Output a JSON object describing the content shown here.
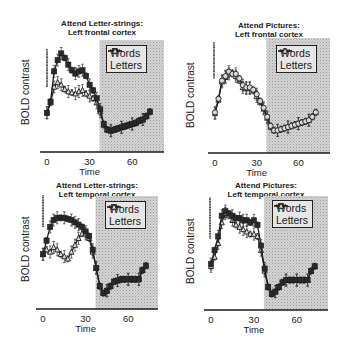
{
  "figure": {
    "panels": [
      {
        "title_line1": "Attend Letter-strings:",
        "title_line2": "Left frontal cortex",
        "ylabel": "BOLD contrast",
        "xlabel": "Time",
        "xticks": [
          "0",
          "30",
          "60"
        ],
        "legend": [
          "Words",
          "Letters"
        ]
      },
      {
        "title_line1": "Attend Pictures:",
        "title_line2": "Left frontal cortex",
        "ylabel": "BOLD contrast",
        "xlabel": "Time",
        "xticks": [
          "0",
          "30",
          "60"
        ],
        "legend": [
          "Words",
          "Letters"
        ]
      },
      {
        "title_line1": "Attend Letter-strings:",
        "title_line2": "Left temporal cortex",
        "ylabel": "BOLD contrast",
        "xlabel": "Time",
        "xticks": [
          "0",
          "30",
          "60"
        ],
        "legend": [
          "Words",
          "Letters"
        ]
      },
      {
        "title_line1": "Attend Pictures:",
        "title_line2": "Left temporal cortex",
        "ylabel": "BOLD contrast",
        "xlabel": "Time",
        "xticks": [
          "0",
          "30",
          "60"
        ],
        "legend": [
          "Words",
          "Letters"
        ]
      }
    ]
  },
  "chart_data": [
    {
      "type": "line",
      "title": "Attend Letter-strings: Left frontal cortex",
      "xlabel": "Time",
      "ylabel": "BOLD contrast",
      "xlim": [
        -4,
        82
      ],
      "ylim": [
        0,
        100
      ],
      "xticks": [
        0,
        30,
        60
      ],
      "shaded_region": [
        37,
        82
      ],
      "legend_position": "upper right",
      "grid": false,
      "x": [
        0,
        2.5,
        5,
        7.5,
        10,
        12.5,
        15,
        17.5,
        20,
        22.5,
        25,
        27.5,
        30,
        32.5,
        35,
        37.5,
        40,
        42.5,
        45,
        47.5,
        50,
        52.5,
        55,
        57.5,
        60,
        62.5,
        65,
        67.5,
        70,
        72.5
      ],
      "series": [
        {
          "name": "Words",
          "marker": "filled-square",
          "values": [
            35,
            45,
            72,
            82,
            88,
            84,
            78,
            73,
            70,
            72,
            73,
            68,
            60,
            55,
            48,
            38,
            25,
            20,
            19,
            20,
            21,
            22,
            23,
            24,
            25,
            26,
            28,
            29,
            32,
            36
          ]
        },
        {
          "name": "Letters",
          "marker": "open-triangle",
          "values": [
            35,
            44,
            58,
            62,
            60,
            56,
            54,
            53,
            52,
            54,
            55,
            52,
            50,
            48,
            44,
            36,
            24,
            20,
            19,
            20,
            21,
            22,
            23,
            24,
            25,
            26,
            28,
            29,
            32,
            36
          ]
        }
      ],
      "scale_bar": {
        "y_from": 58,
        "y_to": 92
      }
    },
    {
      "type": "line",
      "title": "Attend Pictures: Left frontal cortex",
      "xlabel": "Time",
      "ylabel": "BOLD contrast",
      "xlim": [
        -4,
        82
      ],
      "ylim": [
        0,
        100
      ],
      "xticks": [
        0,
        30,
        60
      ],
      "shaded_region": [
        37,
        82
      ],
      "legend_position": "upper right",
      "grid": false,
      "x": [
        0,
        2.5,
        5,
        7.5,
        10,
        12.5,
        15,
        17.5,
        20,
        22.5,
        25,
        27.5,
        30,
        32.5,
        35,
        37.5,
        40,
        42.5,
        45,
        47.5,
        50,
        52.5,
        55,
        57.5,
        60,
        62.5,
        65,
        67.5,
        70,
        72.5
      ],
      "series": [
        {
          "name": "Words",
          "marker": "open-circle",
          "values": [
            36,
            48,
            64,
            68,
            72,
            70,
            70,
            66,
            60,
            58,
            58,
            56,
            52,
            46,
            40,
            32,
            24,
            20,
            20,
            21,
            22,
            23,
            24,
            25,
            26,
            27,
            28,
            29,
            32,
            36
          ]
        },
        {
          "name": "Letters",
          "marker": "open-triangle",
          "values": [
            35,
            47,
            63,
            67,
            70,
            71,
            68,
            64,
            58,
            57,
            57,
            55,
            50,
            45,
            39,
            31,
            23,
            20,
            20,
            21,
            22,
            23,
            24,
            25,
            26,
            27,
            28,
            29,
            32,
            36
          ]
        }
      ],
      "scale_bar": {
        "y_from": 66,
        "y_to": 98
      }
    },
    {
      "type": "line",
      "title": "Attend Letter-strings: Left temporal cortex",
      "xlabel": "Time",
      "ylabel": "BOLD contrast",
      "xlim": [
        -4,
        82
      ],
      "ylim": [
        0,
        100
      ],
      "xticks": [
        0,
        30,
        60
      ],
      "shaded_region": [
        37,
        82
      ],
      "legend_position": "upper right",
      "grid": false,
      "x": [
        0,
        2.5,
        5,
        7.5,
        10,
        12.5,
        15,
        17.5,
        20,
        22.5,
        25,
        27.5,
        30,
        32.5,
        35,
        37.5,
        40,
        42.5,
        45,
        47.5,
        50,
        52.5,
        55,
        57.5,
        60,
        62.5,
        65,
        67.5,
        70,
        72.5
      ],
      "series": [
        {
          "name": "Words",
          "marker": "filled-square",
          "values": [
            48,
            60,
            72,
            78,
            80,
            80,
            80,
            79,
            78,
            76,
            74,
            72,
            68,
            64,
            52,
            36,
            20,
            14,
            16,
            20,
            24,
            25,
            26,
            26,
            26,
            26,
            26,
            26,
            34,
            38
          ]
        },
        {
          "name": "Letters",
          "marker": "open-triangle",
          "values": [
            48,
            52,
            50,
            54,
            52,
            48,
            46,
            44,
            50,
            56,
            62,
            66,
            66,
            62,
            50,
            36,
            20,
            14,
            16,
            20,
            24,
            25,
            26,
            26,
            26,
            26,
            26,
            26,
            34,
            38
          ]
        }
      ],
      "scale_bar": {
        "y_from": 72,
        "y_to": 100
      }
    },
    {
      "type": "line",
      "title": "Attend Pictures: Left temporal cortex",
      "xlabel": "Time",
      "ylabel": "BOLD contrast",
      "xlim": [
        -4,
        82
      ],
      "ylim": [
        0,
        100
      ],
      "xticks": [
        0,
        30,
        60
      ],
      "shaded_region": [
        37,
        82
      ],
      "legend_position": "upper right",
      "grid": false,
      "x": [
        0,
        2.5,
        5,
        7.5,
        10,
        12.5,
        15,
        17.5,
        20,
        22.5,
        25,
        27.5,
        30,
        32.5,
        35,
        37.5,
        40,
        42.5,
        45,
        47.5,
        50,
        52.5,
        55,
        57.5,
        60,
        62.5,
        65,
        67.5,
        70,
        72.5
      ],
      "series": [
        {
          "name": "Words",
          "marker": "filled-square",
          "values": [
            40,
            52,
            64,
            82,
            86,
            84,
            82,
            80,
            80,
            78,
            78,
            76,
            78,
            74,
            56,
            36,
            20,
            14,
            16,
            20,
            24,
            26,
            26,
            26,
            26,
            26,
            26,
            26,
            34,
            38
          ]
        },
        {
          "name": "Letters",
          "marker": "open-triangle",
          "values": [
            38,
            46,
            58,
            76,
            84,
            82,
            78,
            74,
            72,
            70,
            68,
            66,
            66,
            64,
            52,
            34,
            20,
            14,
            16,
            20,
            24,
            26,
            26,
            26,
            26,
            26,
            26,
            26,
            34,
            38
          ]
        }
      ],
      "scale_bar": {
        "y_from": 62,
        "y_to": 98
      }
    }
  ]
}
